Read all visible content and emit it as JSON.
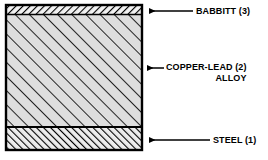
{
  "diagram": {
    "box": {
      "x": 5,
      "y": 4,
      "width": 138,
      "height": 147,
      "border_color": "#000000",
      "border_width": 2
    },
    "layers": [
      {
        "id": "babbitt",
        "name": "BABBITT",
        "number": "(3)",
        "label": "BABBITT (3)",
        "y_top": 5,
        "y_bottom": 14,
        "fill": "#f2f2f2",
        "hatch_direction": "backslash",
        "hatch_spacing": 5,
        "hatch_color": "#000000"
      },
      {
        "id": "copper-lead-alloy",
        "name": "COPPER-LEAD",
        "number": "(2)",
        "label_line_1": "COPPER-LEAD (2)",
        "label_line_2": "ALLOY",
        "y_top": 14,
        "y_bottom": 127,
        "fill": "#dedede",
        "hatch_direction": "slash",
        "hatch_spacing": 10,
        "hatch_color": "#1a1a1a"
      },
      {
        "id": "steel",
        "name": "STEEL",
        "number": "(1)",
        "label": "STEEL (1)",
        "y_top": 127,
        "y_bottom": 150,
        "fill": "#ededed",
        "hatch_direction": "slash",
        "hatch_spacing": 5,
        "hatch_color": "#000000"
      }
    ],
    "callouts": [
      {
        "id": "callout-babbitt",
        "icon": "arrow-left-icon",
        "arrow_y": 11,
        "arrow_tip_x": 148,
        "arrow_tail_x": 193,
        "label": "BABBITT (3)"
      },
      {
        "id": "callout-copper-lead",
        "icon": "arrow-left-icon",
        "arrow_y": 68,
        "arrow_tip_x": 146,
        "arrow_tail_x": 164,
        "label": "COPPER-LEAD (2) ALLOY"
      },
      {
        "id": "callout-steel",
        "icon": "arrow-left-icon",
        "arrow_y": 140,
        "arrow_tip_x": 148,
        "arrow_tail_x": 210,
        "label": "STEEL (1)"
      }
    ],
    "colors": {
      "stroke": "#000000",
      "background": "#ffffff",
      "alloy_fill": "#dedede"
    }
  }
}
